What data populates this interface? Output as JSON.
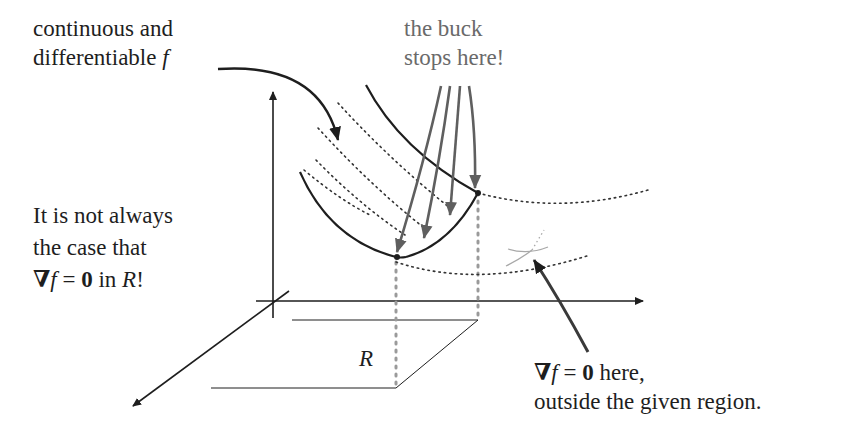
{
  "labels": {
    "top_left": {
      "line1": "continuous and",
      "line2_text": "differentiable ",
      "line2_math": "f"
    },
    "top_middle": {
      "line1": "the buck",
      "line2": "stops here!"
    },
    "left": {
      "line1": "It is not always",
      "line2": "the case that",
      "line3_nabla": "∇",
      "line3_f": "f",
      "line3_eq": " = ",
      "line3_zero": "0",
      "line3_in": " in ",
      "line3_R": "R",
      "line3_bang": "!"
    },
    "region": "R",
    "bottom_right": {
      "line1_nabla": "∇",
      "line1_f": "f",
      "line1_eq": " = ",
      "line1_zero": "0",
      "line1_rest": " here,",
      "line2": "outside the given region."
    }
  },
  "colors": {
    "ink": "#1e1e1e",
    "gray_arrow": "#5f5f5f",
    "gray_text": "#6a6a6a",
    "dotted": "#333333",
    "light_gray": "#a0a0a0",
    "background": "#ffffff"
  }
}
